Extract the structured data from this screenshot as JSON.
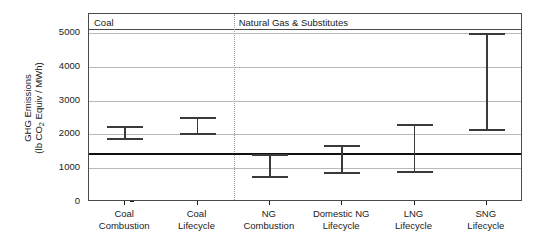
{
  "chart_data": {
    "type": "bar",
    "subtype": "range-interval-plot",
    "title": "",
    "xlabel": "",
    "ylabel": "GHG Emissions (lb CO2 Equiv / MWh)",
    "ylabel_line1": "GHG Emissions",
    "ylabel_line2_pre": "(lb CO",
    "ylabel_line2_sub": "2",
    "ylabel_line2_post": " Equiv / MWh)",
    "ylim": [
      0,
      5300
    ],
    "yticks": [
      0,
      1000,
      2000,
      3000,
      4000,
      5000
    ],
    "ytick_labels": [
      "0",
      "1000",
      "2000",
      "3000",
      "4000",
      "5000"
    ],
    "grid": "horizontal",
    "legend": "none",
    "reference_line": {
      "label": "",
      "value": 1430
    },
    "panels": [
      {
        "label": "Coal",
        "categories": [
          "Coal Combustion",
          "Coal Lifecycle"
        ]
      },
      {
        "label": "Natural Gas & Substitutes",
        "categories": [
          "NG Combustion",
          "Domestic NG Lifecycle",
          "LNG Lifecycle",
          "SNG Lifecycle"
        ]
      }
    ],
    "categories": [
      "Coal Combustion",
      "Coal Lifecycle",
      "NG Combustion",
      "Domestic NG Lifecycle",
      "LNG Lifecycle",
      "SNG Lifecycle"
    ],
    "category_labels": [
      [
        "Coal",
        "Combustion"
      ],
      [
        "Coal",
        "Lifecycle"
      ],
      [
        "NG",
        "Combustion"
      ],
      [
        "Domestic NG",
        "Lifecycle"
      ],
      [
        "LNG",
        "Lifecycle"
      ],
      [
        "SNG",
        "Lifecycle"
      ]
    ],
    "series": [
      {
        "name": "GHG Emissions Range",
        "low": [
          1820,
          1990,
          700,
          830,
          850,
          2100
        ],
        "high": [
          2250,
          2510,
          1430,
          1700,
          2320,
          5000
        ]
      }
    ]
  },
  "colors": {
    "background": "#ffffff",
    "axis": "#4a4a4a",
    "grid": "#b9b9b9",
    "bar": "#3a3a3a",
    "reference": "#111111",
    "divider": "#9a9a9a",
    "text": "#1a1a1a"
  }
}
